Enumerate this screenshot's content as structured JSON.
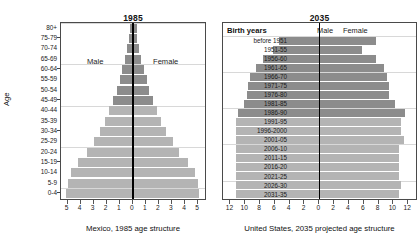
{
  "figure": {
    "axis_title_age": "Age"
  },
  "left_panel": {
    "title": "1985",
    "caption": "Mexico, 1985 age structure",
    "male_label": "Male",
    "female_label": "Female"
  },
  "right_panel": {
    "title": "2035",
    "caption": "United States, 2035 projected age structure",
    "birth_years_heading": "Birth years",
    "male_label": "Male",
    "female_label": "Female"
  },
  "chart_data": [
    {
      "type": "bar",
      "subtype": "population-pyramid",
      "title": "1985",
      "caption": "Mexico, 1985 age structure",
      "xlabel": "",
      "ylabel": "Age",
      "xlim": [
        -5.5,
        5.5
      ],
      "xticks": [
        5,
        4,
        3,
        2,
        1,
        0,
        1,
        2,
        3,
        4,
        5
      ],
      "xtick_values": [
        -5,
        -4,
        -3,
        -2,
        -1,
        0,
        1,
        2,
        3,
        4,
        5
      ],
      "grid": true,
      "legend_position": "in-plot",
      "categories": [
        "80+",
        "75-79",
        "70-74",
        "65-69",
        "60-64",
        "55-59",
        "50-54",
        "45-49",
        "40-44",
        "35-39",
        "30-34",
        "25-29",
        "20-24",
        "15-19",
        "10-14",
        "5-9",
        "0-4"
      ],
      "series": [
        {
          "name": "Male",
          "values": [
            0.25,
            0.3,
            0.45,
            0.6,
            0.8,
            1.0,
            1.2,
            1.5,
            1.8,
            2.1,
            2.5,
            3.0,
            3.5,
            4.2,
            4.7,
            5.0,
            5.1
          ]
        },
        {
          "name": "Female",
          "values": [
            0.3,
            0.35,
            0.5,
            0.65,
            0.85,
            1.05,
            1.25,
            1.55,
            1.85,
            2.15,
            2.55,
            3.05,
            3.55,
            4.25,
            4.75,
            5.0,
            5.1
          ]
        }
      ],
      "shading": {
        "dark_categories": [
          "80+",
          "75-79",
          "70-74",
          "65-69",
          "60-64",
          "55-59",
          "50-54",
          "45-49"
        ],
        "light_categories": [
          "40-44",
          "35-39",
          "30-34",
          "25-29",
          "20-24",
          "15-19",
          "10-14",
          "5-9",
          "0-4"
        ],
        "dark_color": "#8c8c8c",
        "light_color": "#b4b4b4"
      }
    },
    {
      "type": "bar",
      "subtype": "population-pyramid",
      "title": "2035",
      "caption": "United States, 2035 projected age structure",
      "xlabel": "",
      "ylabel": "Birth years",
      "xlim": [
        -13,
        13
      ],
      "xticks": [
        12,
        10,
        8,
        6,
        4,
        2,
        0,
        2,
        4,
        6,
        8,
        10,
        12
      ],
      "xtick_values": [
        -12,
        -10,
        -8,
        -6,
        -4,
        -2,
        0,
        2,
        4,
        6,
        8,
        10,
        12
      ],
      "grid": true,
      "legend_position": "top",
      "categories": [
        "before 1951",
        "1951-55",
        "1956-60",
        "1961-65",
        "1966-70",
        "1971-75",
        "1976-80",
        "1981-85",
        "1986-90",
        "1991-95",
        "1996-2000",
        "2001-05",
        "2006-10",
        "2011-15",
        "2016-20",
        "2021-25",
        "2026-30",
        "2031-35"
      ],
      "series": [
        {
          "name": "Male",
          "values": [
            5.5,
            6.2,
            7.6,
            8.6,
            9.4,
            9.6,
            9.8,
            10.2,
            11.0,
            11.2,
            11.2,
            11.2,
            11.2,
            11.2,
            11.2,
            11.2,
            11.2,
            11.2
          ]
        },
        {
          "name": "Female",
          "values": [
            7.6,
            5.8,
            7.6,
            8.8,
            9.2,
            9.4,
            9.4,
            10.2,
            11.6,
            11.0,
            11.0,
            11.4,
            10.8,
            10.8,
            10.8,
            10.8,
            11.0,
            10.8
          ]
        }
      ],
      "shading": {
        "dark_categories": [
          "before 1951",
          "1951-55",
          "1956-60",
          "1961-65",
          "1966-70",
          "1971-75",
          "1976-80",
          "1981-85",
          "1986-90"
        ],
        "light_categories": [
          "1991-95",
          "1996-2000",
          "2001-05",
          "2006-10",
          "2011-15",
          "2016-20",
          "2021-25",
          "2026-30",
          "2031-35"
        ],
        "dark_color": "#8c8c8c",
        "light_color": "#b4b4b4"
      }
    }
  ]
}
